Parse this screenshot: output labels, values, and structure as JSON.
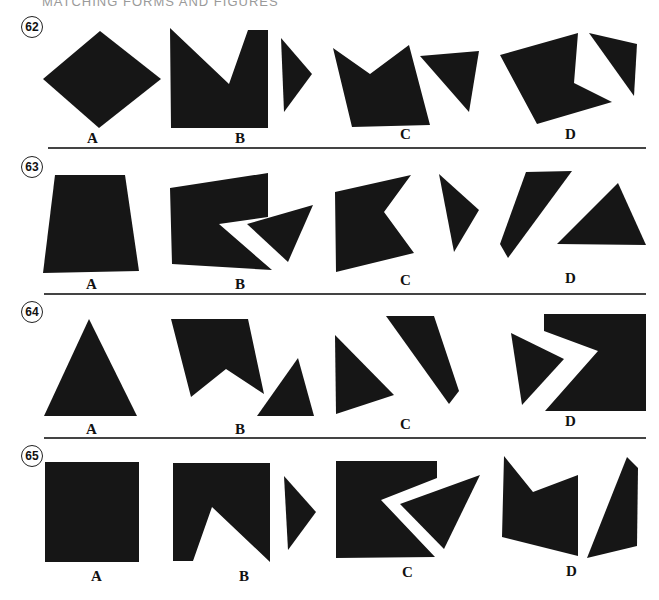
{
  "header": "MATCHING FORMS AND FIGURES",
  "problems": [
    {
      "number": "62",
      "options": [
        "A",
        "B",
        "C",
        "D"
      ]
    },
    {
      "number": "63",
      "options": [
        "A",
        "B",
        "C",
        "D"
      ]
    },
    {
      "number": "64",
      "options": [
        "A",
        "B",
        "C",
        "D"
      ]
    },
    {
      "number": "65",
      "options": [
        "A",
        "B",
        "C",
        "D"
      ]
    }
  ]
}
